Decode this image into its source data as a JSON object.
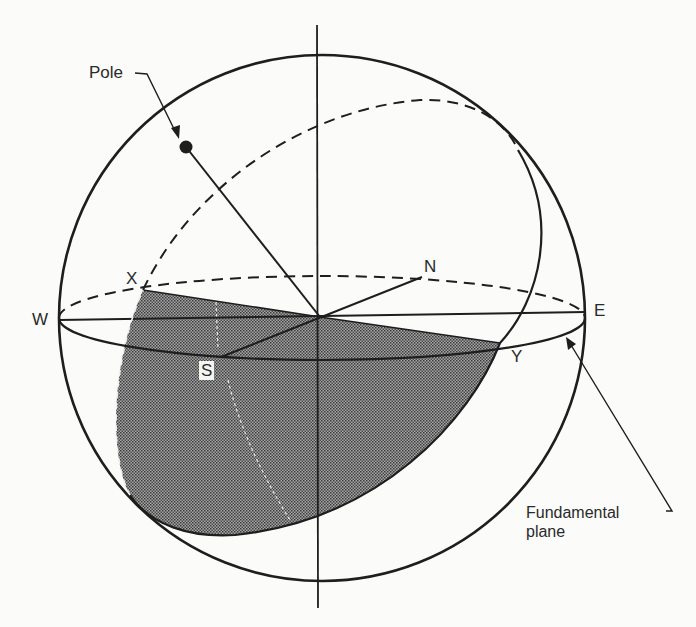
{
  "figure": {
    "type": "celestial-sphere",
    "title": "",
    "labels": {
      "pole": "Pole",
      "west": "W",
      "east": "E",
      "north": "N",
      "south": "S",
      "x_point": "X",
      "y_point": "Y",
      "fundamental_plane_line1": "Fundamental",
      "fundamental_plane_line2": "plane"
    },
    "colors": {
      "line": "#1e1e1e",
      "shade": "#8a8a8a",
      "background": "#fbfbf9"
    },
    "elements": [
      "outer sphere outline",
      "vertical axis through sphere center",
      "horizon (fundamental plane) ellipse, back half dashed",
      "W-E diameter",
      "S-N diameter",
      "tilted great circle through X and Y, back half dashed",
      "pole point with line to center",
      "shaded hemisphere region bounded by X-center-Y and front great-circle arc",
      "arrow from 'Fundamental plane' label to horizon ellipse",
      "arrow from 'Pole' label to pole dot"
    ]
  }
}
